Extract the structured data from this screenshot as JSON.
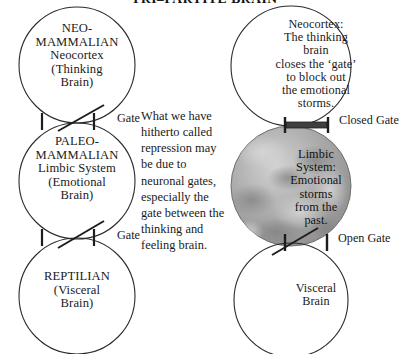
{
  "title": "TRI–PARTITE BRAIN",
  "colors": {
    "ink": "#1a1a1a",
    "stroke": "#2b2b2b",
    "limbic_fill_light": "#c9c9c9",
    "limbic_fill_mid": "#a6a6a6",
    "limbic_fill_dark": "#8a8a8a",
    "closed_gate_bar": "#3a3a3a",
    "background": "#ffffff"
  },
  "left_column": {
    "name": "tri-partite-model",
    "circles": [
      {
        "id": "neo-mammalian",
        "lines": [
          "NEO-",
          "MAMMALIAN",
          "Neocortex",
          "(Thinking",
          "Brain)"
        ],
        "text": "NEO-\nMAMMALIAN\nNeocortex\n(Thinking\nBrain)"
      },
      {
        "id": "paleo-mammalian",
        "lines": [
          "PALEO-",
          "MAMMALIAN",
          "Limbic System",
          "(Emotional",
          "Brain)"
        ],
        "text": "PALEO-\nMAMMALIAN\nLimbic System\n(Emotional\nBrain)"
      },
      {
        "id": "reptilian",
        "lines": [
          "REPTILIAN",
          "(Visceral",
          "Brain)"
        ],
        "text": "REPTILIAN\n(Visceral\nBrain)"
      }
    ],
    "gates": [
      {
        "id": "upper-gate",
        "label": "Gate",
        "state": "open"
      },
      {
        "id": "lower-gate",
        "label": "Gate",
        "state": "open"
      }
    ]
  },
  "center": {
    "paragraph": "What we have\nhitherto called\nrepression may\nbe due to\nneuronal gates,\nespecially the\ngate between the\nthinking and\nfeeling brain.",
    "plain": "What we have hitherto called repression may be due to neuronal gates, especially the gate between the thinking and feeling brain."
  },
  "right_column": {
    "name": "gating-illustration",
    "circles": [
      {
        "id": "neocortex",
        "lines": [
          "Neocortex:",
          "The thinking",
          "brain",
          "closes the ‘gate’",
          "to block out",
          "the emotional",
          "storms."
        ],
        "text": "Neocortex:\nThe thinking\nbrain\ncloses the ‘gate’\nto block out\nthe emotional\nstorms."
      },
      {
        "id": "limbic-system",
        "shaded": true,
        "lines": [
          "Limbic",
          "System:",
          "Emotional",
          "storms",
          "from the",
          "past."
        ],
        "text": "Limbic\nSystem:\nEmotional\nstorms\nfrom the\npast."
      },
      {
        "id": "visceral-brain",
        "lines": [
          "Visceral",
          "Brain"
        ],
        "text": "Visceral\nBrain"
      }
    ],
    "gates": [
      {
        "id": "closed-gate",
        "label": "Closed Gate",
        "state": "closed"
      },
      {
        "id": "open-gate",
        "label": "Open Gate",
        "state": "open"
      }
    ]
  }
}
